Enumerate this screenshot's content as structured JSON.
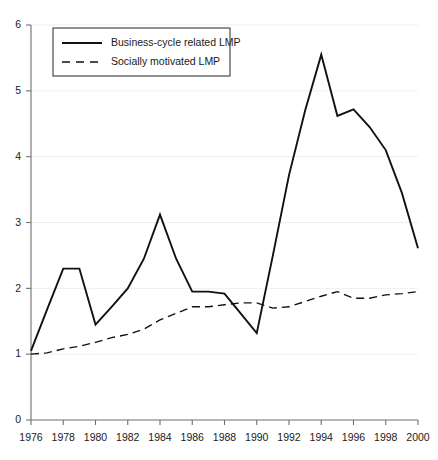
{
  "chart_data": {
    "type": "line",
    "title": "",
    "subtitle": "",
    "xlabel": "",
    "ylabel": "",
    "xlim": [
      1976,
      2000
    ],
    "ylim": [
      0,
      6
    ],
    "grid": true,
    "legend_position": "top-left",
    "x_tick_labels": [
      "1976",
      "1978",
      "1980",
      "1982",
      "1984",
      "1986",
      "1988",
      "1990",
      "1992",
      "1994",
      "1996",
      "1998",
      "2000"
    ],
    "x_ticks": [
      1976,
      1978,
      1980,
      1982,
      1984,
      1986,
      1988,
      1990,
      1992,
      1994,
      1996,
      1998,
      2000
    ],
    "y_tick_labels": [
      "0",
      "1",
      "2",
      "3",
      "4",
      "5",
      "6"
    ],
    "y_ticks": [
      0,
      1,
      2,
      3,
      4,
      5,
      6
    ],
    "x": [
      1976,
      1977,
      1978,
      1979,
      1980,
      1981,
      1982,
      1983,
      1984,
      1985,
      1986,
      1987,
      1988,
      1989,
      1990,
      1991,
      1992,
      1993,
      1994,
      1995,
      1996,
      1997,
      1998,
      1999,
      2000
    ],
    "series": [
      {
        "name": "Business-cycle related LMP",
        "style": "solid",
        "color": "#111111",
        "values": [
          1.05,
          1.68,
          2.3,
          2.3,
          1.45,
          1.72,
          2.0,
          2.45,
          3.12,
          2.45,
          1.95,
          1.95,
          1.92,
          1.62,
          1.32,
          2.5,
          3.72,
          4.7,
          5.55,
          4.62,
          4.72,
          4.45,
          4.1,
          3.45,
          2.61
        ]
      },
      {
        "name": "Socially motivated LMP",
        "style": "dashed",
        "color": "#111111",
        "values": [
          1.0,
          1.02,
          1.08,
          1.12,
          1.18,
          1.25,
          1.3,
          1.38,
          1.52,
          1.62,
          1.72,
          1.72,
          1.75,
          1.78,
          1.78,
          1.7,
          1.72,
          1.8,
          1.88,
          1.95,
          1.85,
          1.85,
          1.9,
          1.92,
          1.95
        ]
      }
    ]
  },
  "legend": {
    "entries": [
      {
        "label": "Business-cycle related LMP",
        "style": "solid"
      },
      {
        "label": "Socially motivated LMP",
        "style": "dashed"
      }
    ]
  },
  "axes": {
    "y_axis_name": "value-axis",
    "x_axis_name": "year-axis"
  }
}
